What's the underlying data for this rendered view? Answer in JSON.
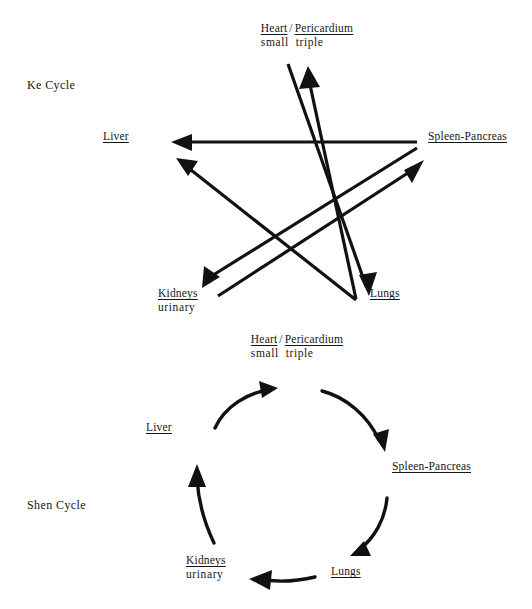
{
  "page": {
    "width": 532,
    "height": 609,
    "background": "#ffffff",
    "ink": "#161616"
  },
  "cycles": [
    {
      "id": "ke",
      "name": "Ke Cycle"
    },
    {
      "id": "shen",
      "name": "Shen Cycle"
    }
  ],
  "organs": {
    "heart": {
      "primary": "Heart",
      "separator": "/",
      "secondary": "Pericardium",
      "sub_primary": "small",
      "sub_secondary": "triple"
    },
    "liver": {
      "primary": "Liver"
    },
    "spleen": {
      "primary": "Spleen-Pancreas"
    },
    "kidneys": {
      "primary": "Kidneys",
      "sub_primary": "urinary"
    },
    "lungs": {
      "primary": "Lungs"
    }
  },
  "ke_cycle": {
    "label": "Ke Cycle",
    "nodes": [
      {
        "key": "heart",
        "label": "Heart / Pericardium",
        "x": 307,
        "y": 30
      },
      {
        "key": "liver",
        "label": "Liver",
        "x": 122,
        "y": 137
      },
      {
        "key": "spleen",
        "label": "Spleen-Pancreas",
        "x": 428,
        "y": 137
      },
      {
        "key": "kidneys",
        "label": "Kidneys",
        "x": 183,
        "y": 292
      },
      {
        "key": "lungs",
        "label": "Lungs",
        "x": 371,
        "y": 292
      }
    ],
    "edges": [
      {
        "from": "heart",
        "to": "lungs",
        "shape": "straight",
        "arrow": "end"
      },
      {
        "from": "lungs",
        "to": "liver",
        "shape": "straight",
        "arrow": "end"
      },
      {
        "from": "liver",
        "to": "spleen",
        "shape": "straight",
        "arrow": "end"
      },
      {
        "from": "spleen",
        "to": "kidneys",
        "shape": "straight",
        "arrow": "end"
      },
      {
        "from": "kidneys",
        "to": "heart",
        "shape": "straight",
        "arrow": "end"
      }
    ]
  },
  "shen_cycle": {
    "label": "Shen Cycle",
    "nodes": [
      {
        "key": "heart",
        "label": "Heart / Pericardium",
        "x": 297,
        "y": 341
      },
      {
        "key": "liver",
        "label": "Liver",
        "x": 146,
        "y": 425
      },
      {
        "key": "spleen",
        "label": "Spleen-Pancreas",
        "x": 392,
        "y": 464
      },
      {
        "key": "kidneys",
        "label": "Kidneys",
        "x": 186,
        "y": 558
      },
      {
        "key": "lungs",
        "label": "Lungs",
        "x": 331,
        "y": 568
      }
    ],
    "edges": [
      {
        "from": "liver",
        "to": "heart",
        "shape": "curved",
        "arrow": "end"
      },
      {
        "from": "heart",
        "to": "spleen",
        "shape": "curved",
        "arrow": "end"
      },
      {
        "from": "spleen",
        "to": "lungs",
        "shape": "curved",
        "arrow": "end"
      },
      {
        "from": "lungs",
        "to": "kidneys",
        "shape": "curved",
        "arrow": "end"
      },
      {
        "from": "kidneys",
        "to": "liver",
        "shape": "curved",
        "arrow": "end"
      }
    ]
  }
}
